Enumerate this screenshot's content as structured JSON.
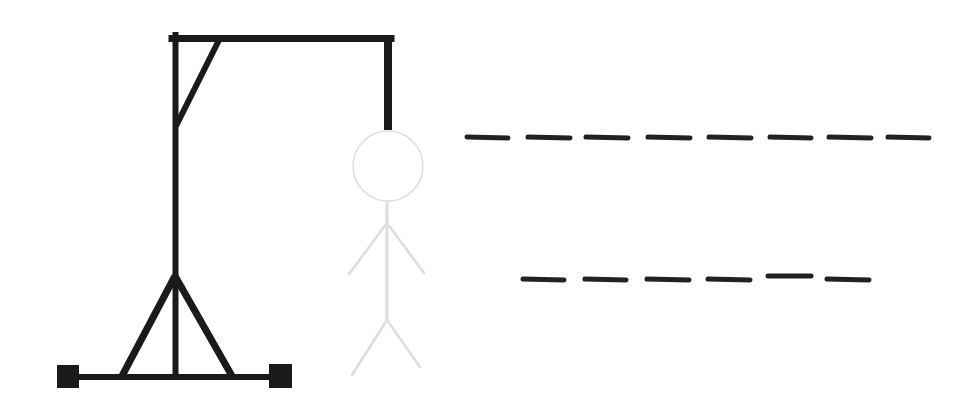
{
  "game": {
    "type": "hangman",
    "colors": {
      "gallows": "#1a1a1a",
      "figure": "#dedede",
      "blanks": "#222222",
      "background": "#ffffff"
    },
    "word_rows": [
      {
        "blank_count": 8,
        "letters": [
          "",
          "",
          "",
          "",
          "",
          "",
          "",
          ""
        ]
      },
      {
        "blank_count": 6,
        "letters": [
          "",
          "",
          "",
          "",
          "",
          ""
        ]
      }
    ],
    "figure_parts": [
      "head",
      "body",
      "left-arm",
      "right-arm",
      "left-leg",
      "right-leg"
    ]
  }
}
